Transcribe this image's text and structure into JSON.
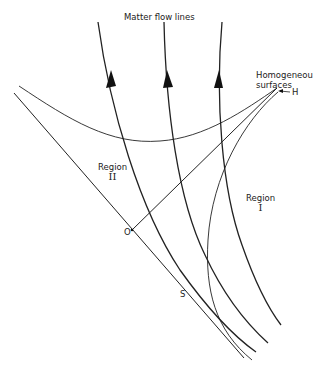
{
  "diagram": {
    "title": "Matter flow lines",
    "labels": {
      "homogeneous_line1": "Homogeneous",
      "homogeneous_line2": "surfaces",
      "h_point": "H",
      "region2_word": "Region",
      "region2_numeral": "II",
      "region1_word": "Region",
      "region1_numeral": "I",
      "o_point": "O",
      "s_point": "S"
    },
    "colors": {
      "line": "#222222",
      "background": "#ffffff"
    },
    "elements": {
      "flow_lines": 3,
      "flow_line_direction": "upward"
    }
  }
}
